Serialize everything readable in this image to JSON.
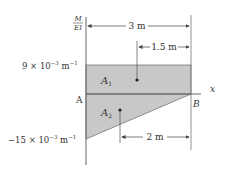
{
  "axis": {
    "y_label_numerator": "M",
    "y_label_denominator": "EI",
    "x_label": "x"
  },
  "points": {
    "A": "A",
    "B": "B"
  },
  "values": {
    "top_value": "9 × 10",
    "top_exp": "−3",
    "top_unit": " m",
    "top_unit_exp": "−1",
    "bottom_value": "−15 × 10",
    "bottom_exp": "−3",
    "bottom_unit": " m",
    "bottom_unit_exp": "−1"
  },
  "areas": {
    "a1_label": "A",
    "a1_sub": "1",
    "a2_label": "A",
    "a2_sub": "2"
  },
  "dimensions": {
    "total": "3 m",
    "a1_centroid": "1.5 m",
    "a2_centroid": "2 m"
  },
  "colors": {
    "fill": "#c8c8c8",
    "line": "#555555"
  }
}
